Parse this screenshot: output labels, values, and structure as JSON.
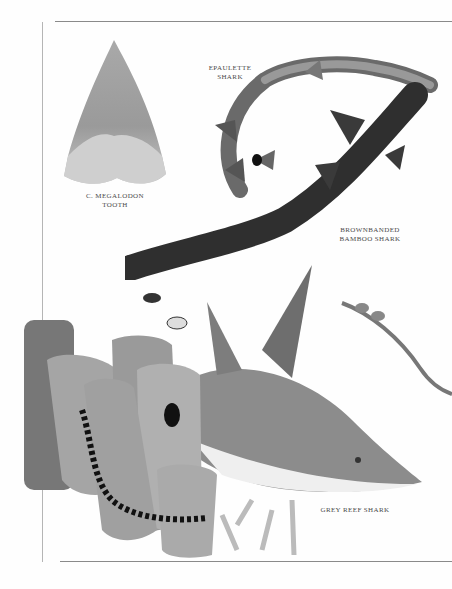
{
  "page": {
    "captions": {
      "megalodon": [
        "C. Megalodon",
        "Tooth"
      ],
      "epaulette": [
        "Epaulette",
        "Shark"
      ],
      "brownbanded": [
        "Brownbanded",
        "Bamboo Shark"
      ],
      "grey_reef": [
        "Grey reef shark"
      ]
    },
    "colors": {
      "paper": "#fefefe",
      "rule": "#8a8a8a",
      "shark_grey": "#8c8c8c",
      "dark_shark": "#3a3a3a"
    }
  }
}
